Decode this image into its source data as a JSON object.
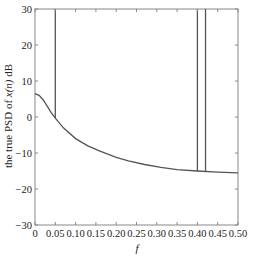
{
  "chart_data": {
    "type": "line",
    "title": "",
    "xlabel": "f",
    "ylabel": "the true PSD of x(n) dB",
    "xlim": [
      0,
      0.5
    ],
    "ylim": [
      -30,
      30
    ],
    "grid": false,
    "legend": null,
    "x_ticks": [
      0,
      0.05,
      0.1,
      0.15,
      0.2,
      0.25,
      0.3,
      0.35,
      0.4,
      0.45,
      0.5
    ],
    "x_tick_labels": [
      "0",
      "0.05",
      "0.10",
      "0.15",
      "0.20",
      "0.25",
      "0.30",
      "0.35",
      "0.40",
      "0.45",
      "0.50"
    ],
    "y_ticks": [
      -30,
      -20,
      -10,
      0,
      10,
      20,
      30
    ],
    "y_tick_labels": [
      "−30",
      "−20",
      "−10",
      "0",
      "10",
      "20",
      "30"
    ],
    "series": [
      {
        "name": "true PSD",
        "color": "#555555",
        "x": [
          0,
          0.01,
          0.02,
          0.03,
          0.04,
          0.05,
          0.07,
          0.1,
          0.13,
          0.16,
          0.2,
          0.23,
          0.27,
          0.31,
          0.35,
          0.4,
          0.45,
          0.5
        ],
        "y": [
          6.5,
          6.0,
          4.8,
          3.0,
          1.2,
          -0.3,
          -3.0,
          -6.0,
          -8.0,
          -9.5,
          -11.2,
          -12.2,
          -13.2,
          -14.0,
          -14.6,
          -15.0,
          -15.3,
          -15.5
        ]
      }
    ],
    "spikes": [
      {
        "f": 0.05,
        "from_db": -0.3,
        "to_db": 30
      },
      {
        "f": 0.4,
        "from_db": -15.0,
        "to_db": 30
      },
      {
        "f": 0.42,
        "from_db": -15.1,
        "to_db": 30
      }
    ]
  }
}
